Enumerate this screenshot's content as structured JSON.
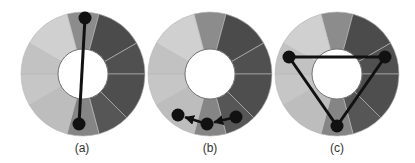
{
  "figure": {
    "background": "#ffffff",
    "wheel": {
      "outer_radius": 62,
      "inner_radius": 25,
      "separator_color": "#b8b8b8",
      "inner_stroke": "#555555",
      "segments": [
        {
          "start": -15,
          "end": 15,
          "color": "#8c8c8c"
        },
        {
          "start": 15,
          "end": 60,
          "color": "#4b4b4b"
        },
        {
          "start": 60,
          "end": 90,
          "color": "#505050"
        },
        {
          "start": 90,
          "end": 135,
          "color": "#4e4e4e"
        },
        {
          "start": 135,
          "end": 165,
          "color": "#565656"
        },
        {
          "start": 165,
          "end": 195,
          "color": "#858585"
        },
        {
          "start": 195,
          "end": 240,
          "color": "#bdbdbd"
        },
        {
          "start": 240,
          "end": 270,
          "color": "#c6c6c6"
        },
        {
          "start": 270,
          "end": 300,
          "color": "#c2c2c2"
        },
        {
          "start": 300,
          "end": 345,
          "color": "#d0d0d0"
        }
      ]
    },
    "marker": {
      "radius": 6.5,
      "color": "#111111",
      "line_width": 3
    },
    "panels": [
      {
        "id": "a",
        "label": "(a)",
        "center": [
          83,
          74
        ],
        "label_pos": [
          82,
          152
        ],
        "type": "line",
        "points": [
          [
            85,
            18
          ],
          [
            79,
            124
          ]
        ],
        "arrows": false,
        "closed": false
      },
      {
        "id": "b",
        "label": "(b)",
        "center": [
          210,
          74
        ],
        "label_pos": [
          210,
          152
        ],
        "type": "polyline",
        "points": [
          [
            236,
            117
          ],
          [
            207,
            124
          ],
          [
            178,
            115
          ]
        ],
        "arrows": true,
        "closed": false
      },
      {
        "id": "c",
        "label": "(c)",
        "center": [
          337,
          74
        ],
        "label_pos": [
          337,
          152
        ],
        "type": "triangle",
        "points": [
          [
            289,
            57
          ],
          [
            385,
            57
          ],
          [
            337,
            126
          ]
        ],
        "arrows": false,
        "closed": true
      }
    ]
  }
}
